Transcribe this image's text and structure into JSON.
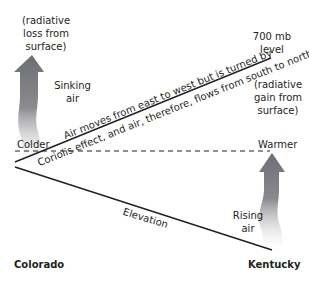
{
  "diagram": {
    "labels": {
      "radiative_loss": [
        "(radiative",
        "loss from",
        "surface)"
      ],
      "sinking_air": [
        "Sinking",
        "air"
      ],
      "level_700mb": [
        "700 mb",
        "level"
      ],
      "radiative_gain": [
        "(radiative",
        "gain from",
        "surface)"
      ],
      "air_moves_line1": "Air moves from east to west but is turned by",
      "air_moves_line2": "Coriolis effect, and air, therefore, flows from south to north",
      "colder": "Colder",
      "warmer": "Warmer",
      "elevation": "Elevation",
      "rising_air": [
        "Rising",
        "air"
      ],
      "colorado": "Colorado",
      "kentucky": "Kentucky"
    },
    "colors": {
      "line": "#231f20",
      "arrow_dark": "#6d6e71",
      "arrow_light": "#ffffff"
    }
  }
}
